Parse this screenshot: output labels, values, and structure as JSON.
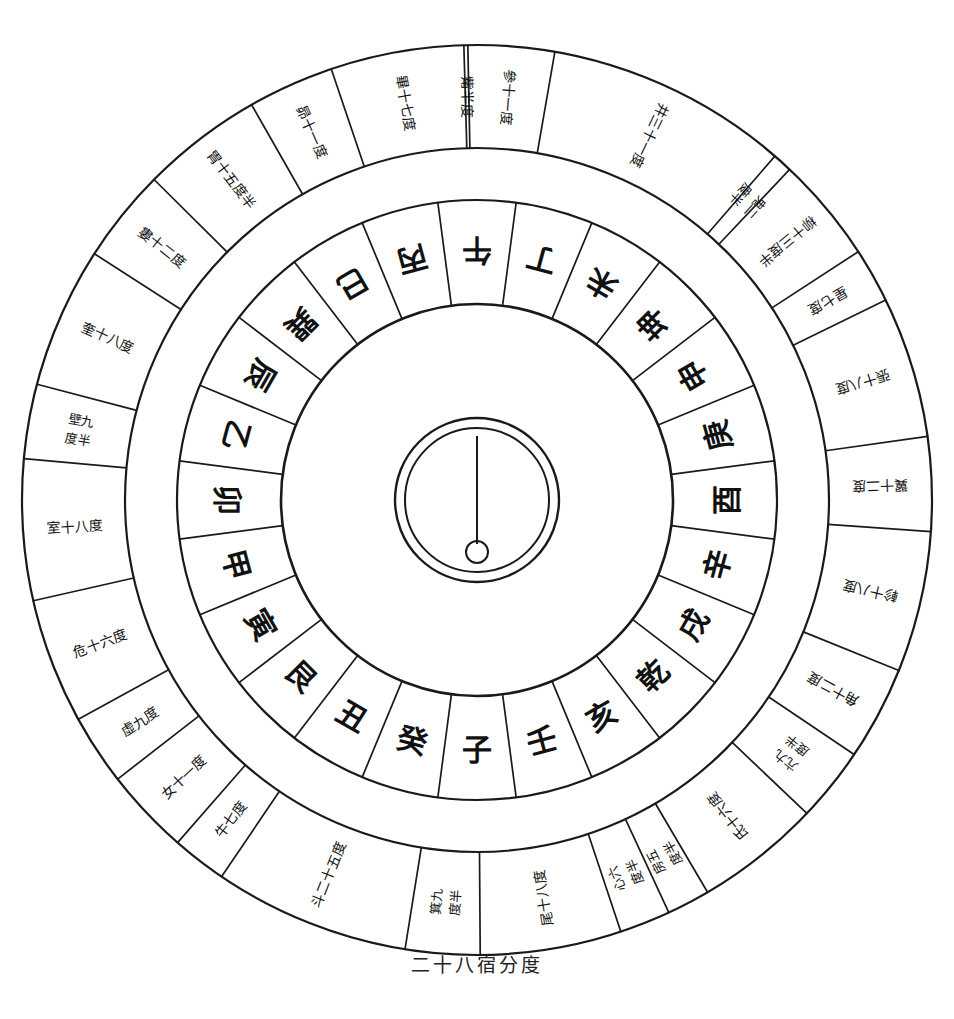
{
  "figure": {
    "caption": "二十八宿分度",
    "title": "二十八宿分度",
    "ink_color": "#1a1a1a",
    "paper_color": "#ffffff"
  },
  "chart_data": {
    "type": "pie",
    "title": "二十八宿分度",
    "xlabel": "",
    "ylabel": "",
    "legend": "none",
    "grid": false,
    "rings": [
      {
        "name": "outer-ring-28-mansions",
        "label": "二十八宿",
        "note": "Degrees of the 28 lunar mansions, read clockwise",
        "categories": [
          "角十二度",
          "亢九度半",
          "氐十六度",
          "房五度半",
          "心六度半",
          "尾十八度",
          "箕九度半",
          "斗二十五度",
          "牛七度",
          "女十一度",
          "虛九度",
          "危十六度",
          "室十八度",
          "壁九度半",
          "奎十八度",
          "婁十二度",
          "胃十五度半",
          "昴十一度",
          "畢十七度",
          "觜半度",
          "參十一度",
          "井三十一度",
          "鬼二度半",
          "柳十三度半",
          "星七度",
          "張十八度",
          "翼十二度",
          "軫十八度"
        ],
        "values": [
          12,
          9.5,
          16,
          5.5,
          6.5,
          18,
          9.5,
          25,
          7,
          11,
          9,
          16,
          18,
          9.5,
          18,
          12,
          15.5,
          11,
          17,
          0.5,
          11,
          31,
          2.5,
          13.5,
          7,
          18,
          12,
          18
        ],
        "unit": "度"
      },
      {
        "name": "inner-ring-24-mountains",
        "label": "二十四山",
        "note": "24 directional mountains, read clockwise from ESE",
        "categories": [
          "巳",
          "丙",
          "午",
          "丁",
          "未",
          "坤",
          "申",
          "庚",
          "酉",
          "辛",
          "戌",
          "乾",
          "亥",
          "壬",
          "子",
          "癸",
          "丑",
          "艮",
          "寅",
          "甲",
          "卯",
          "乙",
          "辰",
          "巽"
        ],
        "values": [
          15,
          15,
          15,
          15,
          15,
          15,
          15,
          15,
          15,
          15,
          15,
          15,
          15,
          15,
          15,
          15,
          15,
          15,
          15,
          15,
          15,
          15,
          15,
          15
        ],
        "unit": "度"
      }
    ]
  },
  "outer_ring": {
    "name": "二十八宿",
    "cells": [
      {
        "mansion": "角",
        "degree": "十二度",
        "text": "角十二度"
      },
      {
        "mansion": "亢",
        "degree": "九度半",
        "text": "亢九度半"
      },
      {
        "mansion": "氐",
        "degree": "十六度",
        "text": "氐十六度"
      },
      {
        "mansion": "房",
        "degree": "五度半",
        "text": "房五度半"
      },
      {
        "mansion": "心",
        "degree": "六度半",
        "text": "心六度半"
      },
      {
        "mansion": "尾",
        "degree": "十八度",
        "text": "尾十八度"
      },
      {
        "mansion": "箕",
        "degree": "九度半",
        "text": "箕九度半"
      },
      {
        "mansion": "斗",
        "degree": "二十五度",
        "text": "斗二十五度"
      },
      {
        "mansion": "牛",
        "degree": "七度",
        "text": "牛七度"
      },
      {
        "mansion": "女",
        "degree": "十一度",
        "text": "女十一度"
      },
      {
        "mansion": "虛",
        "degree": "九度",
        "text": "虛九度"
      },
      {
        "mansion": "危",
        "degree": "十六度",
        "text": "危十六度"
      },
      {
        "mansion": "室",
        "degree": "十八度",
        "text": "室十八度"
      },
      {
        "mansion": "壁",
        "degree": "九度半",
        "text": "壁九度半"
      },
      {
        "mansion": "奎",
        "degree": "十八度",
        "text": "奎十八度"
      },
      {
        "mansion": "婁",
        "degree": "十二度",
        "text": "婁十二度"
      },
      {
        "mansion": "胃",
        "degree": "十五度半",
        "text": "胃十五度半"
      },
      {
        "mansion": "昴",
        "degree": "十一度",
        "text": "昴十一度"
      },
      {
        "mansion": "畢",
        "degree": "十七度",
        "text": "畢十七度"
      },
      {
        "mansion": "觜",
        "degree": "半度",
        "text": "觜半度"
      },
      {
        "mansion": "參",
        "degree": "十一度",
        "text": "參十一度"
      },
      {
        "mansion": "井",
        "degree": "三十一度",
        "text": "井三十一度"
      },
      {
        "mansion": "鬼",
        "degree": "二度半",
        "text": "鬼二度半"
      },
      {
        "mansion": "柳",
        "degree": "十三度半",
        "text": "柳十三度半"
      },
      {
        "mansion": "星",
        "degree": "七度",
        "text": "星七度"
      },
      {
        "mansion": "張",
        "degree": "十八度",
        "text": "張十八度"
      },
      {
        "mansion": "翼",
        "degree": "十二度",
        "text": "翼十二度"
      },
      {
        "mansion": "軫",
        "degree": "十八度",
        "text": "軫十八度"
      }
    ]
  },
  "inner_ring": {
    "name": "二十四山",
    "cells": [
      {
        "text": "巳"
      },
      {
        "text": "丙"
      },
      {
        "text": "午"
      },
      {
        "text": "丁"
      },
      {
        "text": "未"
      },
      {
        "text": "坤"
      },
      {
        "text": "申"
      },
      {
        "text": "庚"
      },
      {
        "text": "酉"
      },
      {
        "text": "辛"
      },
      {
        "text": "戌"
      },
      {
        "text": "乾"
      },
      {
        "text": "亥"
      },
      {
        "text": "壬"
      },
      {
        "text": "子"
      },
      {
        "text": "癸"
      },
      {
        "text": "丑"
      },
      {
        "text": "艮"
      },
      {
        "text": "寅"
      },
      {
        "text": "甲"
      },
      {
        "text": "卯"
      },
      {
        "text": "乙"
      },
      {
        "text": "辰"
      },
      {
        "text": "巽"
      }
    ]
  },
  "hub": {
    "name": "center-hub",
    "outer_circle": "circle",
    "inner_circle": "circle",
    "needle": "pointer-line",
    "pivot": "pivot-dot"
  }
}
